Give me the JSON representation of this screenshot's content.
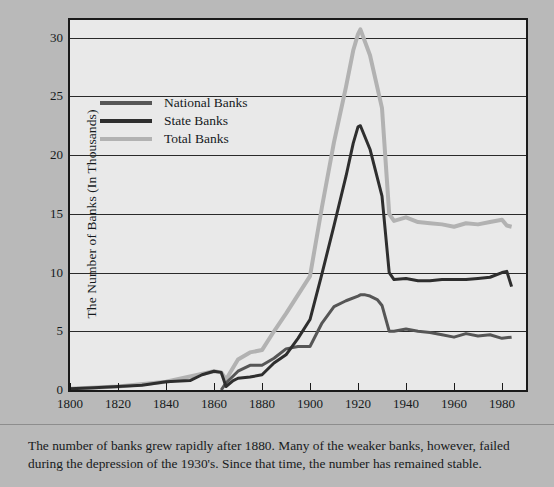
{
  "figure": {
    "background_color": "#b9b9b9",
    "plot_background_color": "#e9e9e9",
    "frame_color": "#1a1a1a"
  },
  "caption": {
    "text": "The number of banks grew rapidly after 1880. Many of the weaker banks, however, failed during the depression of the 1930's. Since that time, the number has remained stable."
  },
  "legend": {
    "position": "upper-left-inside",
    "entries": [
      {
        "label": "National Banks",
        "color": "#565656"
      },
      {
        "label": "State Banks",
        "color": "#2e2e2e"
      },
      {
        "label": "Total Banks",
        "color": "#b2b2b2"
      }
    ]
  },
  "chart_data": {
    "type": "line",
    "title": "",
    "subtitle": "",
    "xlabel": "",
    "ylabel": "The Number of Banks (In Thousands)",
    "xlim": [
      1800,
      1990
    ],
    "ylim": [
      0,
      31.5
    ],
    "xticks": [
      1800,
      1820,
      1840,
      1860,
      1880,
      1900,
      1920,
      1940,
      1960,
      1980
    ],
    "yticks": [
      0,
      5,
      10,
      15,
      20,
      25,
      30
    ],
    "ytick_labels": [
      "0",
      "5",
      "10",
      "15",
      "20",
      "25",
      "30"
    ],
    "xtick_labels": [
      "1800",
      "1820",
      "1840",
      "1860",
      "1880",
      "1900",
      "1920",
      "1940",
      "1960",
      "1980"
    ],
    "grid": "horizontal",
    "annotations": [],
    "series": [
      {
        "name": "National Banks",
        "color": "#565656",
        "width": 3,
        "x": [
          1863,
          1865,
          1870,
          1875,
          1880,
          1885,
          1890,
          1895,
          1900,
          1905,
          1910,
          1915,
          1920,
          1921,
          1923,
          1925,
          1928,
          1930,
          1933,
          1935,
          1940,
          1945,
          1950,
          1955,
          1960,
          1965,
          1970,
          1975,
          1980,
          1984
        ],
        "y": [
          0.0,
          0.6,
          1.6,
          2.1,
          2.1,
          2.7,
          3.5,
          3.7,
          3.7,
          5.7,
          7.1,
          7.6,
          8.0,
          8.1,
          8.1,
          8.0,
          7.7,
          7.2,
          5.0,
          5.0,
          5.2,
          5.0,
          4.9,
          4.7,
          4.5,
          4.8,
          4.6,
          4.7,
          4.4,
          4.5
        ]
      },
      {
        "name": "State Banks",
        "color": "#2e2e2e",
        "width": 3,
        "x": [
          1800,
          1810,
          1820,
          1830,
          1840,
          1850,
          1855,
          1860,
          1863,
          1865,
          1868,
          1870,
          1875,
          1880,
          1885,
          1890,
          1895,
          1900,
          1905,
          1910,
          1915,
          1918,
          1920,
          1921,
          1925,
          1930,
          1933,
          1935,
          1940,
          1945,
          1950,
          1955,
          1960,
          1965,
          1970,
          1975,
          1980,
          1982,
          1984
        ],
        "y": [
          0.1,
          0.2,
          0.3,
          0.4,
          0.7,
          0.8,
          1.3,
          1.6,
          1.5,
          0.3,
          0.8,
          1.0,
          1.1,
          1.3,
          2.3,
          3.0,
          4.4,
          6.0,
          9.9,
          14.0,
          18.2,
          21.0,
          22.4,
          22.5,
          20.5,
          16.5,
          10.0,
          9.4,
          9.5,
          9.3,
          9.3,
          9.4,
          9.4,
          9.4,
          9.5,
          9.6,
          10.0,
          10.1,
          8.8
        ]
      },
      {
        "name": "Total Banks",
        "color": "#b2b2b2",
        "width": 4,
        "x": [
          1800,
          1820,
          1840,
          1860,
          1863,
          1865,
          1870,
          1875,
          1880,
          1885,
          1890,
          1895,
          1900,
          1905,
          1910,
          1915,
          1918,
          1920,
          1921,
          1925,
          1930,
          1933,
          1935,
          1940,
          1945,
          1950,
          1955,
          1960,
          1965,
          1970,
          1975,
          1980,
          1982,
          1984
        ],
        "y": [
          0.1,
          0.3,
          0.7,
          1.6,
          1.5,
          0.9,
          2.6,
          3.2,
          3.4,
          5.0,
          6.5,
          8.1,
          9.7,
          15.6,
          21.1,
          25.8,
          28.9,
          30.3,
          30.7,
          28.5,
          24.0,
          15.0,
          14.4,
          14.7,
          14.3,
          14.2,
          14.1,
          13.9,
          14.2,
          14.1,
          14.3,
          14.5,
          14.0,
          13.9
        ]
      }
    ]
  }
}
